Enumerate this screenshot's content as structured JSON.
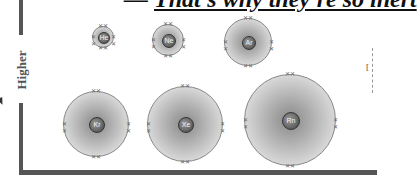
{
  "title": {
    "prefix": "— ",
    "text": "That's why they're so inert"
  },
  "axis": {
    "label": "Higher"
  },
  "atoms": [
    {
      "symbol": "He",
      "cx": 103,
      "cy": 37,
      "r": 11,
      "nr": 5
    },
    {
      "symbol": "Ne",
      "cx": 168,
      "cy": 40,
      "r": 16,
      "nr": 6
    },
    {
      "symbol": "Ar",
      "cx": 248,
      "cy": 42,
      "r": 24,
      "nr": 6
    },
    {
      "symbol": "Kr",
      "cx": 96,
      "cy": 124,
      "r": 33,
      "nr": 7
    },
    {
      "symbol": "Xe",
      "cx": 185,
      "cy": 124,
      "r": 38,
      "nr": 7
    },
    {
      "symbol": "Rn",
      "cx": 290,
      "cy": 120,
      "r": 46,
      "nr": 8
    }
  ],
  "electron_mark": "✕✕"
}
